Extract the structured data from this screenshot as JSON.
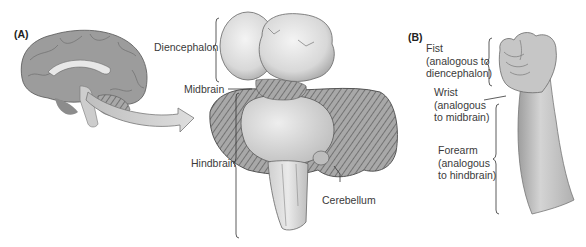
{
  "figure": {
    "panel_a": {
      "label": "(A)",
      "structures": {
        "diencephalon": "Diencephalon",
        "midbrain": "Midbrain",
        "hindbrain": "Hindbrain",
        "cerebellum": "Cerebellum"
      }
    },
    "panel_b": {
      "label": "(B)",
      "analogies": [
        {
          "part": "Fist",
          "line1": "(analogous to",
          "line2": "diencephalon)"
        },
        {
          "part": "Wrist",
          "line1": "(analogous",
          "line2": "to midbrain)"
        },
        {
          "part": "Forearm",
          "line1": "(analogous",
          "line2": "to hindbrain)"
        }
      ]
    }
  }
}
